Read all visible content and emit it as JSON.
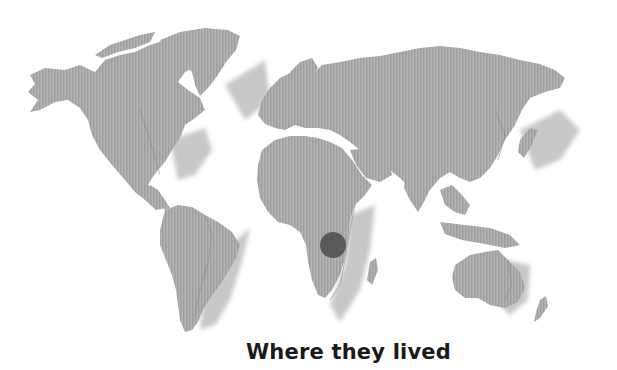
{
  "title": "Where they lived",
  "map": {
    "projection": "world",
    "land_color": "#a9a9a9",
    "land_shadow_color": "#c8c8c8",
    "coast_line_color": "#8a8a8a",
    "marker": {
      "label": "location-marker",
      "region": "Central Africa",
      "cx": 333,
      "cy": 245,
      "r": 13,
      "color": "#555555"
    }
  }
}
